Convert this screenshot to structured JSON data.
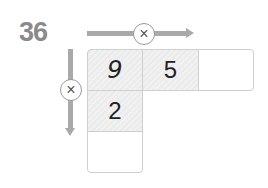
{
  "problem": {
    "number": "36",
    "operator_symbol": "×",
    "grid": {
      "row0": [
        "9",
        "5",
        ""
      ],
      "row1": [
        "2"
      ],
      "row2": [
        ""
      ]
    }
  }
}
